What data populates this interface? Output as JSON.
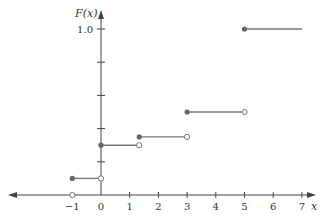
{
  "chart_data": {
    "type": "line",
    "subtype": "step-cdf",
    "title": "",
    "xlabel": "x",
    "ylabel": "F(x)",
    "xlim": [
      -1.5,
      7.5
    ],
    "ylim": [
      0,
      1.0
    ],
    "x_ticks": [
      -1,
      0,
      1,
      2,
      3,
      4,
      5,
      6,
      7
    ],
    "x_tick_labels": [
      "−1",
      "0",
      "1",
      "2",
      "3",
      "4",
      "5",
      "6",
      "7"
    ],
    "y_ticks": [
      0.2,
      0.4,
      0.6,
      0.8,
      1.0
    ],
    "y_tick_labels": [
      "",
      "",
      "",
      "",
      "1.0"
    ],
    "grid": false,
    "legend": null,
    "steps": [
      {
        "x_start": -1.0,
        "x_end": 0.0,
        "y": 0.1,
        "closed_start": true,
        "open_end": true
      },
      {
        "x_start": 0.0,
        "x_end": 1.333,
        "y": 0.3,
        "closed_start": true,
        "open_end": true
      },
      {
        "x_start": 1.333,
        "x_end": 3.0,
        "y": 0.35,
        "closed_start": true,
        "open_end": true
      },
      {
        "x_start": 3.0,
        "x_end": 5.0,
        "y": 0.5,
        "closed_start": true,
        "open_end": true
      },
      {
        "x_start": 5.0,
        "x_end": 7.0,
        "y": 1.0,
        "closed_start": true,
        "open_end": false
      }
    ],
    "zero_segment": {
      "x_end": -1.0,
      "y": 0.0,
      "open_end": true
    }
  },
  "colors": {
    "axis": "#444444",
    "line": "#777777",
    "dot_fill": "#666666",
    "open_dot_fill": "#ffffff"
  }
}
